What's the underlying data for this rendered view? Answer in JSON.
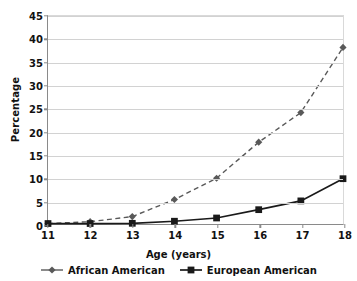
{
  "chart_data": {
    "type": "line",
    "title": "",
    "xlabel": "Age (years)",
    "ylabel": "Percentage",
    "x": [
      11,
      12,
      13,
      14,
      15,
      16,
      17,
      18
    ],
    "xticklabels": [
      "11",
      "12",
      "13",
      "14",
      "15",
      "16",
      "17",
      "18"
    ],
    "xlim": [
      11,
      18
    ],
    "ylim": [
      0,
      45
    ],
    "yticks": [
      0,
      5,
      10,
      15,
      20,
      25,
      30,
      35,
      40,
      45
    ],
    "yticklabels": [
      "0",
      "5",
      "10",
      "15",
      "20",
      "25",
      "30",
      "35",
      "40",
      "45"
    ],
    "grid": "horizontal",
    "legend_position": "bottom",
    "series": [
      {
        "name": "African American",
        "values": [
          0.1,
          0.5,
          1.6,
          5.3,
          9.9,
          17.7,
          24.1,
          38.2
        ],
        "color": "#595959",
        "linestyle": "dashed",
        "marker": "diamond"
      },
      {
        "name": "European American",
        "values": [
          0.1,
          0.1,
          0.15,
          0.6,
          1.3,
          3.1,
          5.0,
          9.8
        ],
        "color": "#1a1a1a",
        "linestyle": "solid",
        "marker": "square"
      }
    ]
  },
  "axis": {
    "line_color": "#8a8a8a",
    "grid_color": "#d2d2d2"
  }
}
